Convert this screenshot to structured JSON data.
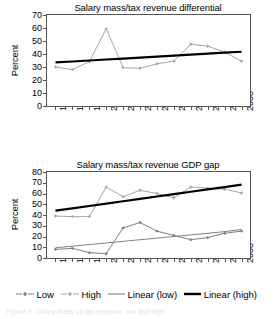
{
  "figure": {
    "ylabel": "Percent",
    "years": [
      "1997",
      "1998",
      "1999",
      "2000",
      "2001",
      "2002",
      "2003",
      "2004",
      "2005",
      "2006",
      "2007",
      "2008"
    ]
  },
  "legend": {
    "items": [
      {
        "label": "Low",
        "marker": "line-with-marker",
        "color": "#7f7f7f"
      },
      {
        "label": "High",
        "marker": "line-with-marker",
        "color": "#a6a6a6"
      },
      {
        "label": "Linear (low)",
        "marker": "thin-line",
        "color": "#808080"
      },
      {
        "label": "Linear (high)",
        "marker": "thick-line",
        "color": "#000000"
      }
    ]
  },
  "caption": {
    "text": "Figure 3. Salary mass vs tax revenue, low and high"
  },
  "chart_data": [
    {
      "id": "differential",
      "type": "line",
      "title": "Salary mass/tax revenue differential",
      "xlabel": "",
      "ylabel": "Percent",
      "categories": [
        "1997",
        "1998",
        "1999",
        "2000",
        "2001",
        "2002",
        "2003",
        "2004",
        "2005",
        "2006",
        "2007",
        "2008"
      ],
      "ylim": [
        0,
        70
      ],
      "yticks": [
        0,
        10,
        20,
        30,
        40,
        50,
        60,
        70
      ],
      "grid": false,
      "legend_position": "below-figure",
      "series": [
        {
          "name": "High",
          "style": "line-with-marker",
          "color": "#a6a6a6",
          "values": [
            30,
            28,
            34,
            59.5,
            29.5,
            29,
            32.5,
            34.5,
            47.5,
            46,
            41.5,
            34.5
          ]
        },
        {
          "name": "Linear (high)",
          "style": "trendline-thick",
          "color": "#000000",
          "values": [
            33.5,
            34.25,
            35,
            35.75,
            36.5,
            37.25,
            38,
            38.75,
            39.5,
            40.25,
            41,
            41.75
          ]
        }
      ]
    },
    {
      "id": "gdp-gap",
      "type": "line",
      "title": "Salary mass/tax revenue GDP gap",
      "xlabel": "",
      "ylabel": "Percent",
      "categories": [
        "1997",
        "1998",
        "1999",
        "2000",
        "2001",
        "2002",
        "2003",
        "2004",
        "2005",
        "2006",
        "2007",
        "2008"
      ],
      "ylim": [
        0,
        80
      ],
      "yticks": [
        0,
        10,
        20,
        30,
        40,
        50,
        60,
        70,
        80
      ],
      "grid": false,
      "legend_position": "below-figure",
      "series": [
        {
          "name": "Low",
          "style": "line-with-marker",
          "color": "#7f7f7f",
          "values": [
            8,
            9,
            5,
            4,
            28,
            33,
            25,
            21,
            17,
            19,
            23,
            25
          ]
        },
        {
          "name": "High",
          "style": "line-with-marker",
          "color": "#a6a6a6",
          "values": [
            39,
            38.5,
            38.5,
            66,
            57,
            63,
            60,
            56,
            66,
            65,
            64,
            60.5
          ]
        },
        {
          "name": "Linear (low)",
          "style": "trendline-thin",
          "color": "#808080",
          "values": [
            9.5,
            11,
            12.5,
            14,
            15.5,
            17,
            18.5,
            20,
            21.5,
            23,
            24.5,
            26.5
          ]
        },
        {
          "name": "Linear (high)",
          "style": "trendline-thick",
          "color": "#000000",
          "values": [
            44,
            46.2,
            48.4,
            50.6,
            52.8,
            55,
            57.2,
            59.4,
            61.6,
            63.8,
            66,
            68.3
          ]
        }
      ]
    }
  ]
}
